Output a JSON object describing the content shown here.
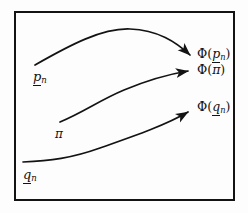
{
  "figure": {
    "name": "phi-mapping-diagram",
    "background_color": "#fdfdfd",
    "ink_color": "#131313",
    "frame": {
      "name": "figure-border",
      "x": 14,
      "y": 11,
      "width": 220,
      "height": 189,
      "stroke_width": 2
    },
    "labels": {
      "source_upper": {
        "base": "p",
        "sub": "n",
        "underlined": true,
        "text": "p̲ₙ"
      },
      "source_middle": {
        "base": "π",
        "sub": "",
        "underlined": false,
        "text": "π"
      },
      "source_lower": {
        "base": "q",
        "sub": "n",
        "underlined": true,
        "text": "q̲ₙ"
      },
      "target_upper": {
        "prefix": "Φ(",
        "base": "p",
        "sub": "n",
        "suffix": ")",
        "underlined": true,
        "text": "Φ(p̲ₙ)"
      },
      "target_middle": {
        "prefix": "Φ(",
        "base": "π",
        "sub": "",
        "suffix": ")",
        "underlined": false,
        "text": "Φ(π)"
      },
      "target_lower": {
        "prefix": "Φ(",
        "base": "q",
        "sub": "n",
        "suffix": ")",
        "underlined": true,
        "text": "Φ(q̲ₙ)"
      }
    },
    "arrows": [
      {
        "name": "arrow-upper",
        "from_label": "p̲ₙ",
        "to_label": "Φ(p̲ₙ)",
        "path": "M 35 65 C 70 45, 102 28, 130 29 C 158 30, 176 42, 190 55",
        "shape": "arc-over-peak"
      },
      {
        "name": "arrow-middle",
        "from_label": "π",
        "to_label": "Φ(π)",
        "path": "M 60 122 C 84 112, 100 100, 124 90 C 148 80, 170 74, 189 71",
        "shape": "rising-s-curve"
      },
      {
        "name": "arrow-lower",
        "from_label": "q̲ₙ",
        "to_label": "Φ(q̲ₙ)",
        "path": "M 23 162 C 50 161, 72 158, 100 148 C 134 136, 166 124, 189 113",
        "shape": "flat-then-rising"
      }
    ]
  }
}
